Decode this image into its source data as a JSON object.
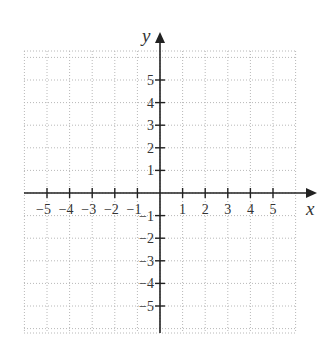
{
  "chart_data": {
    "type": "scatter",
    "title": "",
    "xlabel": "x",
    "ylabel": "y",
    "xlim": [
      -6,
      6
    ],
    "ylim": [
      -6,
      6.3
    ],
    "grid": true,
    "grid_style": "dotted",
    "x_ticks": [
      -5,
      -4,
      -3,
      -2,
      -1,
      1,
      2,
      3,
      4,
      5
    ],
    "y_ticks": [
      -5,
      -4,
      -3,
      -2,
      -1,
      1,
      2,
      3,
      4,
      5
    ],
    "x_tick_labels": [
      "−5",
      "−4",
      "−3",
      "−2",
      "−1",
      "1",
      "2",
      "3",
      "4",
      "5"
    ],
    "y_tick_labels": [
      "−5",
      "−4",
      "−3",
      "−2",
      "−1",
      "1",
      "2",
      "3",
      "4",
      "5"
    ],
    "series": [],
    "legend": null
  },
  "axes": {
    "x_label": "x",
    "y_label": "y"
  },
  "colors": {
    "axis": "#222222",
    "grid": "#b8b8b8",
    "text": "#333333",
    "background": "#ffffff"
  }
}
